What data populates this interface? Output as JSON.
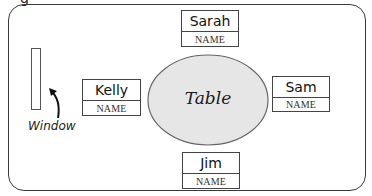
{
  "diagram": {
    "title_fragment": "g",
    "table": {
      "label": "Table",
      "fill": "#e6e6e6",
      "stroke": "#666666"
    },
    "window": {
      "label": "Window"
    },
    "seats": [
      {
        "position": "top",
        "name": "Sarah",
        "label": "NAME"
      },
      {
        "position": "left",
        "name": "Kelly",
        "label": "NAME"
      },
      {
        "position": "right",
        "name": "Sam",
        "label": "NAME"
      },
      {
        "position": "bottom",
        "name": "Jim",
        "label": "NAME"
      }
    ]
  }
}
